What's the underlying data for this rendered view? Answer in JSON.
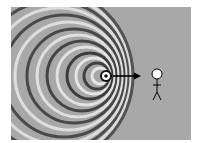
{
  "figure": {
    "source": {
      "x": 106,
      "y": 76
    },
    "arrow": {
      "from": 113,
      "to": 140,
      "y": 76
    },
    "observer": {
      "head_x": 157,
      "head_y": 74
    },
    "colors": {
      "background": "#a8a8a8",
      "dark": "#3a3a3a",
      "light": "#e8e8e8",
      "figure": "#000000"
    }
  }
}
